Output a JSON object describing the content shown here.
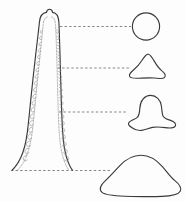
{
  "figure": {
    "background_color": "#fdfdfd",
    "outline_color": "#3a3a3a",
    "texture_color": "#8d8d8d",
    "leader_color": "#6f6f6f",
    "width": 185,
    "height": 202
  },
  "main_profile": {
    "label": "tall tapering spire, elevation view",
    "apex_y": 12,
    "base_y": 170,
    "apex_width": 22,
    "base_width": 78,
    "has_inner_contour": true,
    "has_scale_texture": true,
    "texture_description": "stacked crescent scale marks along both inner flanks"
  },
  "sections": [
    {
      "id": "section-1",
      "label": "circle",
      "level_y": 26,
      "description": "near-circular section at apex level",
      "center_x": 146,
      "center_y": 26,
      "width": 28,
      "height": 28
    },
    {
      "id": "section-2",
      "label": "rounded triangle",
      "level_y": 68,
      "description": "rounded triangular section with small basal lobes",
      "center_x": 148,
      "center_y": 68,
      "width": 40,
      "height": 25
    },
    {
      "id": "section-3",
      "label": "bell with flared lobes",
      "level_y": 112,
      "description": "domed bell section with broad flared lobed base",
      "center_x": 150,
      "center_y": 112,
      "width": 52,
      "height": 32
    },
    {
      "id": "section-4",
      "label": "broad dome",
      "level_y": 170,
      "description": "wide low dome section with flat base",
      "center_x": 140,
      "center_y": 178,
      "width": 84,
      "height": 46
    }
  ],
  "leaders": [
    {
      "id": "leader-1",
      "from_x": 60,
      "to_x": 131,
      "y": 26
    },
    {
      "id": "leader-2",
      "from_x": 57,
      "to_x": 129,
      "y": 68
    },
    {
      "id": "leader-3",
      "from_x": 59,
      "to_x": 127,
      "y": 112
    },
    {
      "id": "leader-4",
      "from_x": 22,
      "to_x": 110,
      "y": 170
    }
  ]
}
